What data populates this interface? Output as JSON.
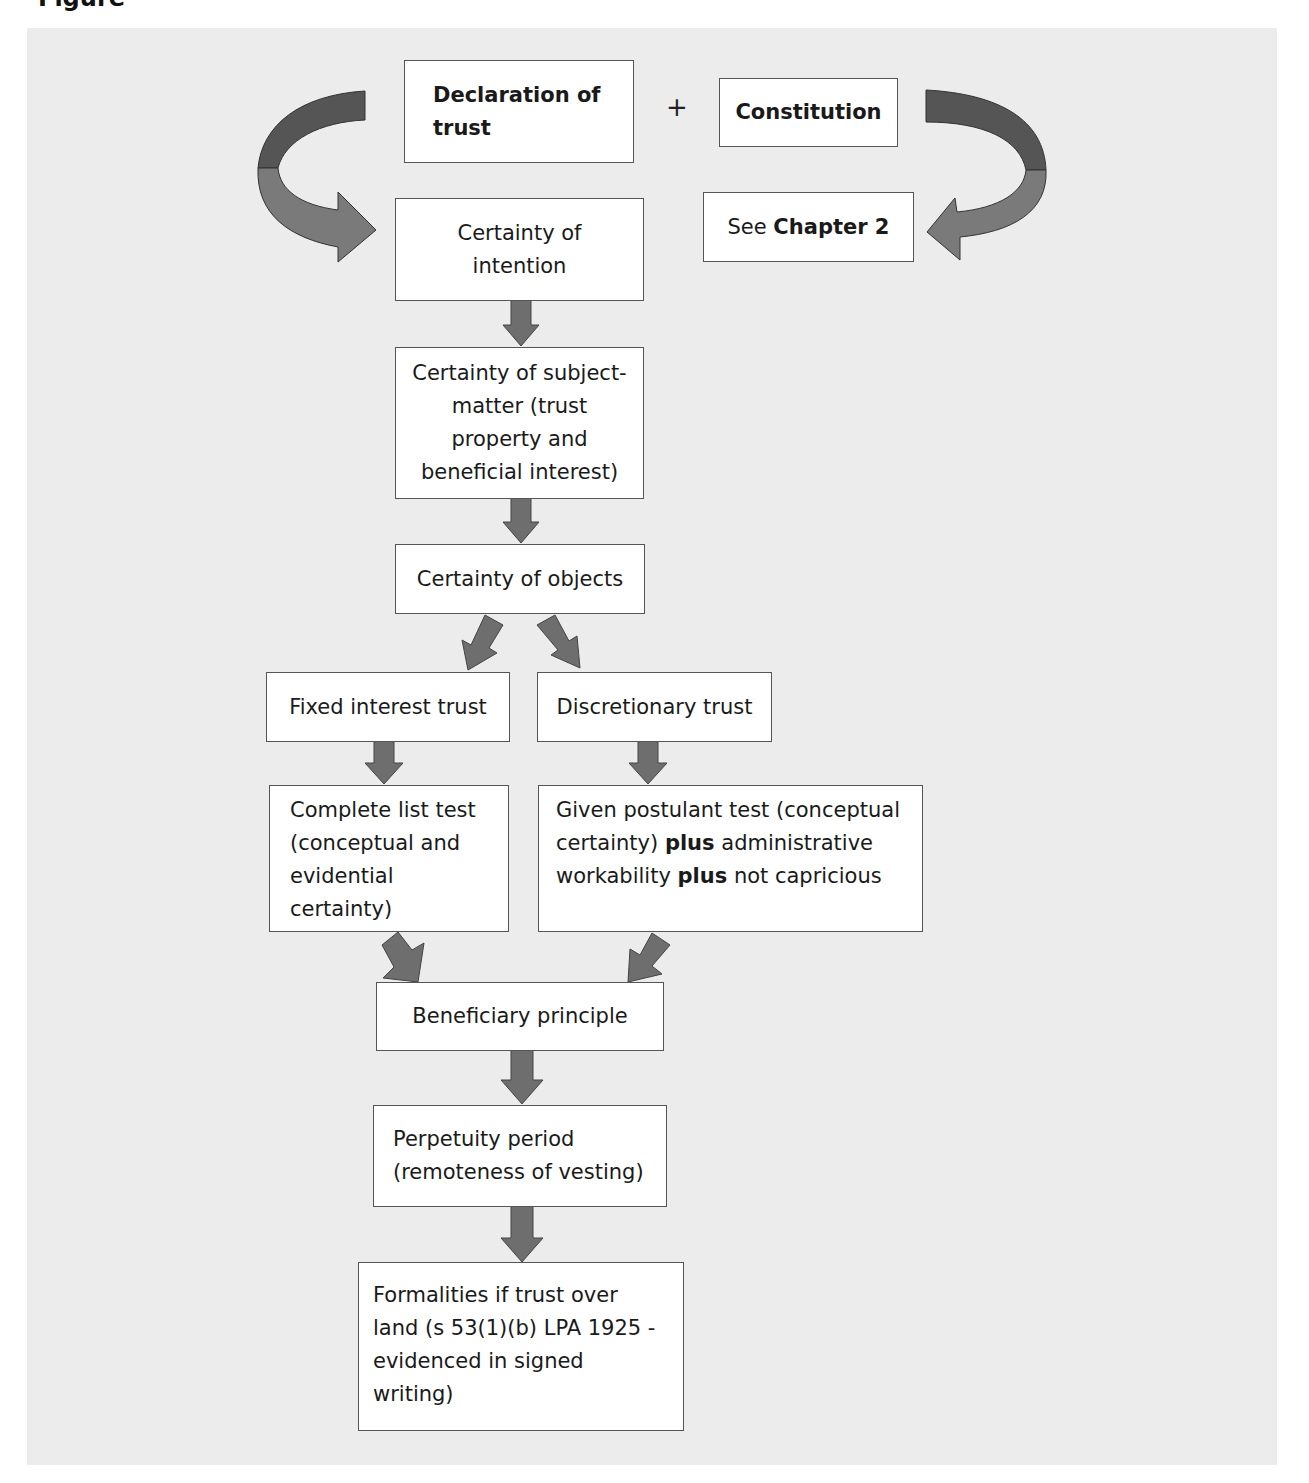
{
  "page": {
    "cut_heading": "Figure",
    "background_panel_color": "#ececec"
  },
  "diagram": {
    "top_row": {
      "declaration": "Declaration of trust",
      "plus": "+",
      "constitution": "Constitution"
    },
    "see_chapter": {
      "prefix": "See",
      "chapter": "Chapter 2"
    },
    "steps": {
      "certainty_intention": "Certainty of intention",
      "certainty_subject_matter": "Certainty of subject-matter (trust property and beneficial interest)",
      "certainty_objects": "Certainty of objects",
      "fixed_interest": "Fixed interest trust",
      "discretionary": "Discretionary trust",
      "complete_list": "Complete list test (conceptual and evidential certainty)",
      "given_postulant": {
        "part1": "Given postulant test (conceptual certainty)",
        "plus1": "plus",
        "part2": "administrative workability",
        "plus2": "plus",
        "part3": "not capricious"
      },
      "beneficiary_principle": "Beneficiary principle",
      "perpetuity": "Perpetuity period (remoteness of vesting)",
      "formalities": "Formalities if trust over land (s 53(1)(b) LPA 1925 - evidenced in signed writing)"
    },
    "colors": {
      "arrow_fill": "#6e6e6e",
      "arrow_dark": "#555555",
      "arrow_light": "#7a7a7a",
      "box_border": "#555555"
    }
  }
}
